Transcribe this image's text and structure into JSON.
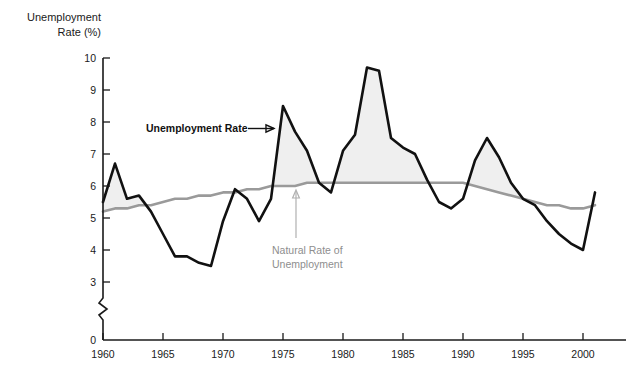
{
  "chart_data": {
    "type": "line",
    "title": "",
    "subtitle": "",
    "xlabel": "",
    "ylabel": "Unemployment\nRate (%)",
    "ylabel_line1": "Unemployment",
    "ylabel_line2": "Rate (%)",
    "xlim": [
      1959,
      2001.5
    ],
    "ylim": [
      2.6,
      10
    ],
    "y_axis_break": true,
    "y_axis_break_note": "axis broken between 0 and ~2.8",
    "grid": false,
    "legend_position": "inline-annotations",
    "y_ticks": [
      0,
      3,
      4,
      5,
      6,
      7,
      8,
      9,
      10
    ],
    "y_tick_labels": [
      "0",
      "3",
      "4",
      "5",
      "6",
      "7",
      "8",
      "9",
      "10"
    ],
    "x_ticks": [
      1960,
      1965,
      1970,
      1975,
      1980,
      1985,
      1990,
      1995,
      2000
    ],
    "x_tick_labels": [
      "1960",
      "1965",
      "1970",
      "1975",
      "1980",
      "1985",
      "1990",
      "1995",
      "2000"
    ],
    "x": [
      1960,
      1961,
      1962,
      1963,
      1964,
      1965,
      1966,
      1967,
      1968,
      1969,
      1970,
      1971,
      1972,
      1973,
      1974,
      1975,
      1976,
      1977,
      1978,
      1979,
      1980,
      1981,
      1982,
      1983,
      1984,
      1985,
      1986,
      1987,
      1988,
      1989,
      1990,
      1991,
      1992,
      1993,
      1994,
      1995,
      1996,
      1997,
      1998,
      1999,
      2000,
      2001
    ],
    "series": [
      {
        "name": "Unemployment Rate",
        "color": "#111111",
        "values": [
          5.5,
          6.7,
          5.6,
          5.7,
          5.2,
          4.5,
          3.8,
          3.8,
          3.6,
          3.5,
          4.9,
          5.9,
          5.6,
          4.9,
          5.6,
          8.5,
          7.7,
          7.1,
          6.1,
          5.8,
          7.1,
          7.6,
          9.7,
          9.6,
          7.5,
          7.2,
          7.0,
          6.2,
          5.5,
          5.3,
          5.6,
          6.8,
          7.5,
          6.9,
          6.1,
          5.6,
          5.4,
          4.9,
          4.5,
          4.2,
          4.0,
          5.8
        ]
      },
      {
        "name": "Natural Rate of Unemployment",
        "color": "#9a9a9a",
        "values": [
          5.2,
          5.3,
          5.3,
          5.4,
          5.4,
          5.5,
          5.6,
          5.6,
          5.7,
          5.7,
          5.8,
          5.8,
          5.9,
          5.9,
          6.0,
          6.0,
          6.0,
          6.1,
          6.1,
          6.1,
          6.1,
          6.1,
          6.1,
          6.1,
          6.1,
          6.1,
          6.1,
          6.1,
          6.1,
          6.1,
          6.1,
          6.0,
          5.9,
          5.8,
          5.7,
          5.6,
          5.5,
          5.4,
          5.4,
          5.3,
          5.3,
          5.4
        ]
      }
    ],
    "annotations": [
      {
        "name": "unemployment-rate-annotation",
        "text": "Unemployment Rate",
        "color": "#111111",
        "arrow": "right"
      },
      {
        "name": "natural-rate-annotation",
        "text_line1": "Natural Rate of",
        "text_line2": "Unemployment",
        "color": "#8e8e8e",
        "arrow": "up"
      }
    ],
    "shading": {
      "name": "gap-between-series",
      "color": "#efefef",
      "description": "light gray fill between the unemployment rate and the natural rate"
    }
  }
}
